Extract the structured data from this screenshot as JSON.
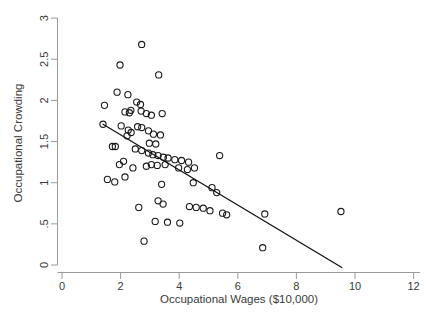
{
  "chart_data": {
    "type": "scatter",
    "title": "",
    "xlabel": "Occupational Wages ($10,000)",
    "ylabel": "Occupational Crowding",
    "xlim": [
      0,
      12.4
    ],
    "ylim": [
      -0.1,
      3.05
    ],
    "xticks": [
      0,
      2,
      4,
      6,
      8,
      10,
      12
    ],
    "xtick_labels": [
      "0",
      "2",
      "4",
      "6",
      "8",
      "10",
      "12"
    ],
    "yticks": [
      0,
      0.5,
      1,
      1.5,
      2,
      2.5,
      3
    ],
    "ytick_labels": [
      "0",
      ".5",
      "1",
      "1.5",
      "2",
      "2.5",
      "3"
    ],
    "grid": false,
    "legend": null,
    "marker_style": "open-circle",
    "marker_color": "#1b1b1b",
    "points": [
      [
        2.72,
        2.68
      ],
      [
        1.98,
        2.43
      ],
      [
        3.3,
        2.31
      ],
      [
        1.88,
        2.1
      ],
      [
        2.25,
        2.07
      ],
      [
        1.45,
        1.94
      ],
      [
        2.55,
        1.98
      ],
      [
        2.68,
        1.95
      ],
      [
        2.15,
        1.86
      ],
      [
        2.3,
        1.85
      ],
      [
        2.35,
        1.88
      ],
      [
        2.7,
        1.87
      ],
      [
        2.88,
        1.84
      ],
      [
        3.05,
        1.82
      ],
      [
        3.42,
        1.84
      ],
      [
        1.4,
        1.71
      ],
      [
        2.02,
        1.69
      ],
      [
        2.26,
        1.64
      ],
      [
        2.36,
        1.61
      ],
      [
        2.22,
        1.57
      ],
      [
        2.58,
        1.68
      ],
      [
        2.72,
        1.67
      ],
      [
        2.95,
        1.63
      ],
      [
        3.12,
        1.59
      ],
      [
        3.36,
        1.58
      ],
      [
        2.98,
        1.48
      ],
      [
        3.2,
        1.47
      ],
      [
        1.72,
        1.44
      ],
      [
        1.82,
        1.44
      ],
      [
        2.5,
        1.41
      ],
      [
        2.72,
        1.39
      ],
      [
        2.95,
        1.36
      ],
      [
        3.1,
        1.34
      ],
      [
        3.28,
        1.33
      ],
      [
        3.46,
        1.31
      ],
      [
        3.62,
        1.3
      ],
      [
        3.85,
        1.28
      ],
      [
        4.08,
        1.27
      ],
      [
        4.32,
        1.25
      ],
      [
        5.38,
        1.33
      ],
      [
        1.96,
        1.22
      ],
      [
        2.1,
        1.26
      ],
      [
        2.42,
        1.18
      ],
      [
        2.88,
        1.2
      ],
      [
        3.05,
        1.22
      ],
      [
        3.25,
        1.21
      ],
      [
        3.52,
        1.22
      ],
      [
        3.98,
        1.18
      ],
      [
        4.28,
        1.16
      ],
      [
        4.52,
        1.18
      ],
      [
        1.55,
        1.04
      ],
      [
        1.8,
        1.01
      ],
      [
        2.15,
        1.07
      ],
      [
        3.4,
        0.98
      ],
      [
        4.48,
        1.0
      ],
      [
        5.12,
        0.94
      ],
      [
        5.28,
        0.88
      ],
      [
        3.28,
        0.78
      ],
      [
        3.45,
        0.74
      ],
      [
        2.62,
        0.7
      ],
      [
        4.35,
        0.71
      ],
      [
        4.58,
        0.7
      ],
      [
        4.82,
        0.69
      ],
      [
        5.05,
        0.66
      ],
      [
        5.48,
        0.63
      ],
      [
        5.62,
        0.61
      ],
      [
        6.92,
        0.62
      ],
      [
        9.52,
        0.65
      ],
      [
        3.18,
        0.53
      ],
      [
        3.6,
        0.52
      ],
      [
        4.02,
        0.51
      ],
      [
        6.85,
        0.21
      ],
      [
        2.8,
        0.29
      ]
    ],
    "fit_line": {
      "type": "linear-fit",
      "x_start": 1.4,
      "y_start": 1.71,
      "x_end": 9.55,
      "y_end": -0.03
    }
  }
}
